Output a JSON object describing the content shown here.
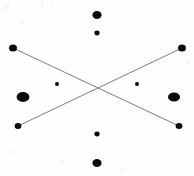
{
  "figure": {
    "width": 194,
    "height": 176,
    "background_color": "#fefefe",
    "marker_color": "#0a0a0a",
    "line_color": "#6e6e6e",
    "line_width": 0.9,
    "caption": ""
  },
  "chart_data": {
    "type": "scatter",
    "xlabel": "",
    "ylabel": "",
    "xlim": [
      0,
      194
    ],
    "ylim": [
      176,
      0
    ],
    "grid": false,
    "legend": null,
    "marker_color": "#0a0a0a",
    "points": [
      {
        "name": "top-outer",
        "x": 97,
        "y": 15,
        "rx": 4.6,
        "ry": 4.0,
        "size": "medium"
      },
      {
        "name": "top-inner",
        "x": 97,
        "y": 33,
        "rx": 2.6,
        "ry": 2.4,
        "size": "small"
      },
      {
        "name": "upper-left-end",
        "x": 13,
        "y": 48,
        "rx": 4.0,
        "ry": 3.6,
        "size": "medium"
      },
      {
        "name": "upper-right-end",
        "x": 182,
        "y": 48,
        "rx": 4.0,
        "ry": 3.6,
        "size": "medium"
      },
      {
        "name": "center-left-tiny",
        "x": 57,
        "y": 84,
        "rx": 2.0,
        "ry": 1.9,
        "size": "tiny"
      },
      {
        "name": "center-right-tiny",
        "x": 137,
        "y": 84,
        "rx": 2.0,
        "ry": 1.9,
        "size": "tiny"
      },
      {
        "name": "mid-left-large",
        "x": 23,
        "y": 97,
        "rx": 6.4,
        "ry": 5.0,
        "size": "large"
      },
      {
        "name": "mid-right-large",
        "x": 174,
        "y": 97,
        "rx": 6.0,
        "ry": 4.6,
        "size": "large"
      },
      {
        "name": "lower-left-end",
        "x": 18,
        "y": 126,
        "rx": 3.4,
        "ry": 3.0,
        "size": "small"
      },
      {
        "name": "lower-right-end",
        "x": 179,
        "y": 126,
        "rx": 3.4,
        "ry": 3.0,
        "size": "small"
      },
      {
        "name": "bottom-inner",
        "x": 97,
        "y": 134,
        "rx": 2.6,
        "ry": 2.4,
        "size": "small"
      },
      {
        "name": "bottom-outer",
        "x": 97,
        "y": 163,
        "rx": 4.6,
        "ry": 4.0,
        "size": "medium"
      }
    ],
    "lines": [
      {
        "name": "diagonal-down-right",
        "x1": 13,
        "y1": 48,
        "x2": 179,
        "y2": 126,
        "color": "#6e6e6e",
        "width": 0.9
      },
      {
        "name": "diagonal-up-right",
        "x1": 18,
        "y1": 126,
        "x2": 182,
        "y2": 48,
        "color": "#6e6e6e",
        "width": 0.9
      }
    ],
    "intersection": {
      "name": "line-crossing",
      "x": 97,
      "y": 88
    }
  }
}
